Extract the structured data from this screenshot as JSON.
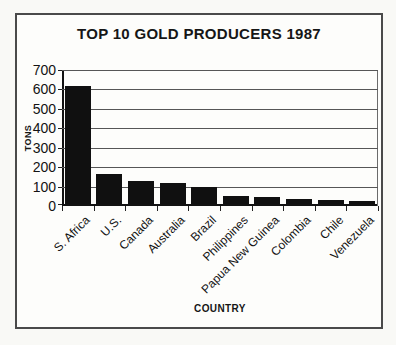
{
  "window": {
    "background": "#f9f9f6"
  },
  "frame": {
    "border_color": "#4a4a4a",
    "background": "#fdfdfb"
  },
  "chart_data": {
    "type": "bar",
    "title": "TOP 10 GOLD PRODUCERS 1987",
    "xlabel": "COUNTRY",
    "ylabel": "TONS",
    "categories": [
      "S. Africa",
      "U.S.",
      "Canada",
      "Australia",
      "Brazil",
      "Philippines",
      "Papua New Guinea",
      "Colombia",
      "Chile",
      "Venezuela"
    ],
    "values": [
      605,
      155,
      120,
      110,
      85,
      40,
      35,
      25,
      20,
      15
    ],
    "ylim": [
      0,
      700
    ],
    "yticks": [
      0,
      100,
      200,
      300,
      400,
      500,
      600,
      700
    ],
    "grid": true,
    "gridline_interval": 100,
    "legend": "none",
    "bar_color": "#101010",
    "axis_color": "#121212",
    "gridline_color": "#565656",
    "x_tick_label_rotation_deg": 45
  }
}
